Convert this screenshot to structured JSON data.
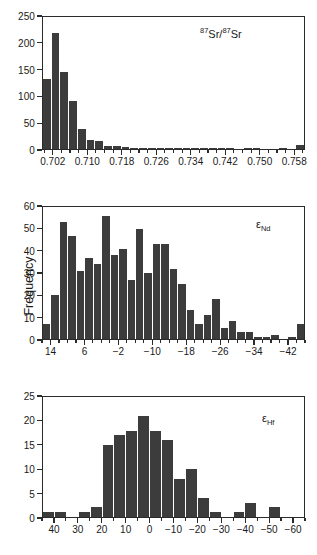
{
  "figure": {
    "y_axis_title": "Frequency",
    "background_color": "#ffffff",
    "bar_color": "#3c3c3c",
    "axis_color": "#2b2b2b"
  },
  "chart_data": [
    {
      "type": "bar",
      "name": "strontium-isotope-histogram",
      "title": "",
      "annotation": "87Sr/87Sr",
      "annotation_parts": {
        "sup1": "87",
        "el1": "Sr",
        "slash": "/",
        "sup2": "87",
        "el2": "Sr"
      },
      "xlabel": "",
      "ylabel": "Frequency",
      "ylim": [
        0,
        250
      ],
      "ytick_values": [
        0,
        50,
        100,
        150,
        200,
        250
      ],
      "ytick_labels": [
        "0",
        "50",
        "100",
        "150",
        "200",
        "250"
      ],
      "xlim": [
        0.6995,
        0.7605
      ],
      "xtick_values": [
        0.702,
        0.706,
        0.71,
        0.714,
        0.718,
        0.722,
        0.726,
        0.73,
        0.734,
        0.738,
        0.742,
        0.746,
        0.75,
        0.754,
        0.758
      ],
      "xtick_major": [
        0.702,
        0.71,
        0.718,
        0.726,
        0.734,
        0.742,
        0.75,
        0.758
      ],
      "xtick_labels": [
        "0.702",
        "0.710",
        "0.718",
        "0.726",
        "0.734",
        "0.742",
        "0.750",
        "0.758"
      ],
      "bin_width": 0.002,
      "bin_starts": [
        0.7,
        0.702,
        0.704,
        0.706,
        0.708,
        0.71,
        0.712,
        0.714,
        0.716,
        0.718,
        0.72,
        0.722,
        0.724,
        0.726,
        0.728,
        0.73,
        0.732,
        0.734,
        0.736,
        0.738,
        0.74,
        0.742,
        0.744,
        0.746,
        0.748,
        0.75,
        0.752,
        0.754,
        0.756,
        0.758
      ],
      "values": [
        133,
        219,
        145,
        90,
        38,
        18,
        16,
        6,
        6,
        3,
        2,
        1,
        1,
        2,
        1,
        1,
        2,
        2,
        1,
        2,
        1,
        1,
        0,
        1,
        1,
        0,
        0,
        1,
        0,
        7
      ],
      "grid": false,
      "legend": "none"
    },
    {
      "type": "bar",
      "name": "epsilon-nd-histogram",
      "title": "",
      "annotation": "eNd",
      "annotation_parts": {
        "greek": "ε",
        "sub": "Nd"
      },
      "xlabel": "",
      "ylabel": "Frequency",
      "ylim": [
        0,
        60
      ],
      "ytick_values": [
        0,
        10,
        20,
        30,
        40,
        50,
        60
      ],
      "ytick_labels": [
        "0",
        "10",
        "20",
        "30",
        "40",
        "50",
        "60"
      ],
      "xlim": [
        16,
        -46
      ],
      "xtick_major": [
        14,
        6,
        -2,
        -10,
        -18,
        -26,
        -34,
        -42
      ],
      "xtick_labels": [
        "14",
        "6",
        "-2",
        "-10",
        "-18",
        "-26",
        "-34",
        "-42"
      ],
      "bin_width": 2,
      "bin_starts": [
        16,
        14,
        12,
        10,
        8,
        6,
        4,
        2,
        0,
        -2,
        -4,
        -6,
        -8,
        -10,
        -12,
        -14,
        -16,
        -18,
        -20,
        -22,
        -24,
        -26,
        -28,
        -30,
        -32,
        -34,
        -36,
        -38,
        -40,
        -42,
        -44
      ],
      "values": [
        7,
        20,
        53,
        47,
        31,
        37,
        34,
        56,
        38,
        41,
        27,
        50,
        30,
        43,
        43,
        32,
        25,
        13,
        7,
        11,
        18,
        5,
        8,
        3,
        3,
        1,
        1,
        2,
        0,
        1,
        7
      ],
      "grid": false,
      "legend": "none"
    },
    {
      "type": "bar",
      "name": "epsilon-hf-histogram",
      "title": "",
      "annotation": "eHf",
      "annotation_parts": {
        "greek": "ε",
        "sub": "Hf"
      },
      "xlabel": "",
      "ylabel": "Frequency",
      "ylim": [
        0,
        25
      ],
      "ytick_values": [
        0,
        5,
        10,
        15,
        20,
        25
      ],
      "ytick_labels": [
        "0",
        "5",
        "10",
        "15",
        "20",
        "25"
      ],
      "xlim": [
        45,
        -65
      ],
      "xtick_major": [
        40,
        30,
        20,
        10,
        0,
        -10,
        -20,
        -30,
        -40,
        -50,
        -60
      ],
      "xtick_labels": [
        "40",
        "30",
        "20",
        "10",
        "0",
        "-10",
        "-20",
        "-30",
        "-40",
        "-50",
        "-60"
      ],
      "bin_width": 5,
      "bin_starts": [
        45,
        40,
        35,
        30,
        25,
        20,
        15,
        10,
        5,
        0,
        -5,
        -10,
        -15,
        -20,
        -25,
        -30,
        -35,
        -40,
        -45,
        -50,
        -55,
        -60
      ],
      "values": [
        1,
        1,
        0,
        1,
        2,
        15,
        17,
        18,
        21,
        18,
        16,
        8,
        10,
        4,
        1,
        0,
        1,
        3,
        0,
        2,
        0,
        0
      ],
      "grid": false,
      "legend": "none"
    }
  ]
}
